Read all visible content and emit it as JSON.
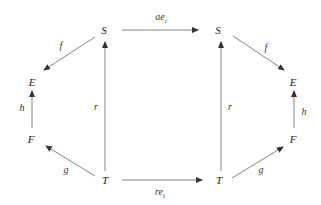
{
  "diagram": {
    "type": "commutative-diagram",
    "nodes": {
      "left_S": "S",
      "left_E": "E",
      "left_F": "F",
      "left_T": "T",
      "right_S": "S",
      "right_E": "E",
      "right_F": "F",
      "right_T": "T"
    },
    "edges": {
      "left_f": "f",
      "left_h": "h",
      "left_g": "g",
      "left_r": "r",
      "right_f": "f",
      "right_h": "h",
      "right_g": "g",
      "right_r": "r",
      "top_base": "ae",
      "top_sub": "i",
      "bottom_base": "re",
      "bottom_sub": "i"
    },
    "colors": {
      "line": "#555555",
      "text": "#222222"
    }
  }
}
